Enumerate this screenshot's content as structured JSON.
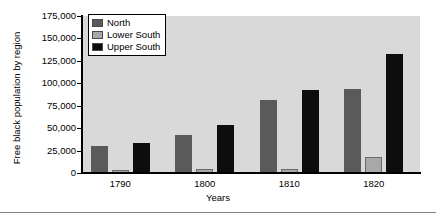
{
  "figure": {
    "plot_background": "#d9d9d9",
    "page_background": "#ffffff"
  },
  "legend": {
    "position": "top-left-inside",
    "entries": [
      {
        "label": "North",
        "color": "#5a5a5a"
      },
      {
        "label": "Lower South",
        "color": "#a8a8a8"
      },
      {
        "label": "Upper South",
        "color": "#0d0d0d"
      }
    ]
  },
  "axes": {
    "ylabel": "Free black population by region",
    "xlabel": "Years",
    "yticks": [
      "0",
      "25,000",
      "50,000",
      "75,000",
      "100,000",
      "125,000",
      "150,000",
      "175,000"
    ],
    "xticks": [
      "1790",
      "1800",
      "1810",
      "1820"
    ]
  },
  "chart_data": {
    "type": "bar",
    "title": "",
    "subtitle": "",
    "xlabel": "Years",
    "ylabel": "Free black population by region",
    "categories": [
      "1790",
      "1800",
      "1810",
      "1820"
    ],
    "series": [
      {
        "name": "North",
        "color": "#5a5a5a",
        "values": [
          30000,
          42000,
          81000,
          94000
        ]
      },
      {
        "name": "Lower South",
        "color": "#a8a8a8",
        "values": [
          3000,
          4000,
          5000,
          18000
        ]
      },
      {
        "name": "Upper South",
        "color": "#0d0d0d",
        "values": [
          33000,
          54000,
          93000,
          133000
        ]
      }
    ],
    "ylim": [
      0,
      175000
    ],
    "ytick_values": [
      0,
      25000,
      50000,
      75000,
      100000,
      125000,
      150000,
      175000
    ],
    "grid": false,
    "legend_position": "upper left"
  }
}
